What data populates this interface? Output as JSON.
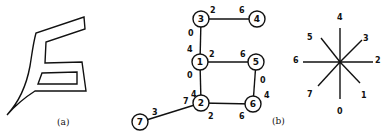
{
  "panels": {
    "a": {
      "caption": "(a)",
      "shape": {
        "outer": [
          [
            7,
            115
          ],
          [
            22,
            90
          ],
          [
            30,
            65
          ],
          [
            36,
            33
          ],
          [
            84,
            17
          ],
          [
            85,
            29
          ],
          [
            46,
            42
          ],
          [
            45,
            63
          ],
          [
            82,
            62
          ],
          [
            86,
            91
          ],
          [
            35,
            91
          ],
          [
            7,
            115
          ]
        ],
        "hole": [
          [
            42,
            73
          ],
          [
            77,
            72
          ],
          [
            77,
            84
          ],
          [
            38,
            84
          ]
        ]
      }
    },
    "b": {
      "caption": "(b)",
      "nodes": [
        {
          "id": "1",
          "x": 200,
          "y": 62
        },
        {
          "id": "2",
          "x": 201,
          "y": 103
        },
        {
          "id": "3",
          "x": 201,
          "y": 19
        },
        {
          "id": "4",
          "x": 257,
          "y": 19
        },
        {
          "id": "5",
          "x": 256,
          "y": 62
        },
        {
          "id": "6",
          "x": 253,
          "y": 104
        },
        {
          "id": "7",
          "x": 140,
          "y": 122
        }
      ],
      "edges": [
        {
          "from": "3",
          "to": "4"
        },
        {
          "from": "3",
          "to": "1"
        },
        {
          "from": "1",
          "to": "5"
        },
        {
          "from": "1",
          "to": "2"
        },
        {
          "from": "5",
          "to": "6"
        },
        {
          "from": "2",
          "to": "6"
        },
        {
          "from": "2",
          "to": "7"
        }
      ],
      "direction_labels": [
        {
          "text": "2",
          "x": 210,
          "y": 10
        },
        {
          "text": "6",
          "x": 239,
          "y": 10
        },
        {
          "text": "0",
          "x": 188,
          "y": 33
        },
        {
          "text": "4",
          "x": 187,
          "y": 49
        },
        {
          "text": "2",
          "x": 209,
          "y": 54
        },
        {
          "text": "0",
          "x": 187,
          "y": 75
        },
        {
          "text": "6",
          "x": 240,
          "y": 54
        },
        {
          "text": "0",
          "x": 260,
          "y": 80
        },
        {
          "text": "4",
          "x": 264,
          "y": 95
        },
        {
          "text": "4",
          "x": 191,
          "y": 94
        },
        {
          "text": "7",
          "x": 183,
          "y": 101
        },
        {
          "text": "2",
          "x": 208,
          "y": 116
        },
        {
          "text": "6",
          "x": 239,
          "y": 116
        },
        {
          "text": "3",
          "x": 152,
          "y": 112
        }
      ]
    },
    "c": {
      "center": {
        "x": 340,
        "y": 62
      },
      "directions": [
        {
          "label": "0",
          "end": [
            340,
            99
          ],
          "lx": 337,
          "ly": 111
        },
        {
          "label": "1",
          "end": [
            360,
            83
          ],
          "lx": 361,
          "ly": 95
        },
        {
          "label": "2",
          "end": [
            373,
            62
          ],
          "lx": 375,
          "ly": 60
        },
        {
          "label": "3",
          "end": [
            362,
            40
          ],
          "lx": 363,
          "ly": 38
        },
        {
          "label": "4",
          "end": [
            340,
            28
          ],
          "lx": 337,
          "ly": 17
        },
        {
          "label": "5",
          "end": [
            321,
            38
          ],
          "lx": 307,
          "ly": 37
        },
        {
          "label": "6",
          "end": [
            303,
            62
          ],
          "lx": 293,
          "ly": 60
        },
        {
          "label": "7",
          "end": [
            318,
            86
          ],
          "lx": 307,
          "ly": 94
        }
      ]
    }
  },
  "captions": {
    "a": "(a)",
    "b": "(b)"
  }
}
